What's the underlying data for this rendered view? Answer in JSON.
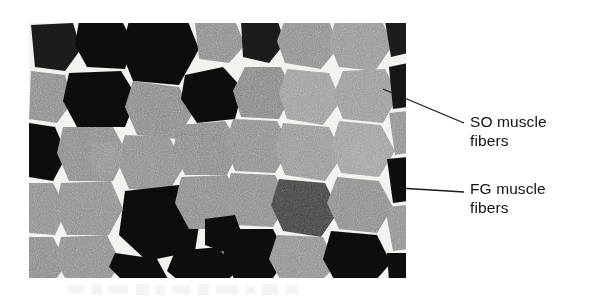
{
  "figure": {
    "background_color": "#ffffff",
    "width": 594,
    "height": 304
  },
  "micrograph": {
    "name": "muscle-fiber-cross-section",
    "description": "Light micrograph of a transverse section of skeletal muscle stained for myosin ATPase, showing a mosaic of polygonal fibers with dark and light staining intensities",
    "bounds": {
      "x": 29,
      "y": 23,
      "width": 377,
      "height": 255
    },
    "fiber_types": [
      {
        "code": "SO",
        "full_name": "slow oxidative",
        "appearance": "light to mid gray",
        "color": "#8f8f8f"
      },
      {
        "code": "FG",
        "full_name": "fast glycolytic",
        "appearance": "dark, nearly black",
        "color": "#121212"
      }
    ],
    "endomysium_color": "#f4f2f0"
  },
  "callouts": [
    {
      "id": "so",
      "line_1": "SO muscle",
      "line_2": "fibers",
      "leader": {
        "x1": 383,
        "y1": 89,
        "x2": 464,
        "y2": 123
      },
      "text_color": "#111111"
    },
    {
      "id": "fg",
      "line_1": "FG muscle",
      "line_2": "fibers",
      "leader": {
        "x1": 399,
        "y1": 188,
        "x2": 464,
        "y2": 192
      },
      "text_color": "#111111"
    }
  ]
}
